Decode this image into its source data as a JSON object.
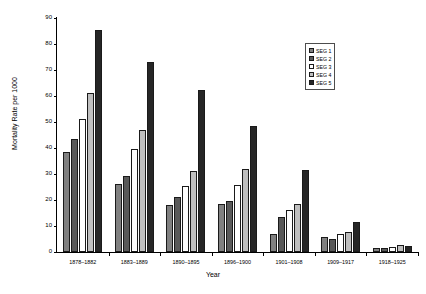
{
  "chart_data": {
    "type": "bar",
    "title": "",
    "xlabel": "Year",
    "ylabel": "Mortality Rate per 1000",
    "ylim": [
      0,
      90
    ],
    "yticks": [
      0,
      10,
      20,
      30,
      40,
      50,
      60,
      70,
      80,
      90
    ],
    "grid": false,
    "legend_position": "top-right",
    "categories": [
      "1878–1882",
      "1883–1889",
      "1890–1895",
      "1896–1900",
      "1901–1908",
      "1909–1917",
      "1918–1925"
    ],
    "series": [
      {
        "name": "SEG 1",
        "color": "#808080",
        "values": [
          38.3,
          26.0,
          18.0,
          18.5,
          7.0,
          5.8,
          1.6
        ]
      },
      {
        "name": "SEG 2",
        "color": "#595959",
        "values": [
          43.5,
          29.4,
          21.0,
          19.5,
          13.6,
          5.0,
          1.5
        ]
      },
      {
        "name": "SEG 3",
        "color": "#ffffff",
        "values": [
          51.3,
          39.6,
          25.5,
          25.8,
          16.0,
          7.1,
          2.0
        ]
      },
      {
        "name": "SEG 4",
        "color": "#bfbfbf",
        "values": [
          61.0,
          47.0,
          31.3,
          31.8,
          18.6,
          7.6,
          2.6
        ]
      },
      {
        "name": "SEG 5",
        "color": "#262626",
        "values": [
          85.3,
          73.0,
          62.3,
          48.6,
          31.4,
          11.7,
          2.5
        ]
      }
    ]
  }
}
